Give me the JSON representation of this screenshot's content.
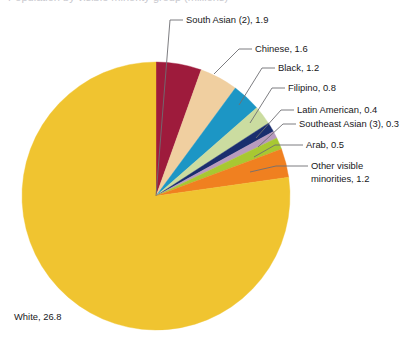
{
  "page": {
    "background_color": "#ffffff",
    "truncated_title": "Population by visible minority group (millions)"
  },
  "chart_data": {
    "type": "pie",
    "title": "",
    "xlabel": "",
    "ylabel": "",
    "units": "millions",
    "total": 34.7,
    "legend_position": "callout-labels",
    "grid": false,
    "categories": [
      "White",
      "South Asian (2)",
      "Chinese",
      "Black",
      "Filipino",
      "Latin American",
      "Southeast Asian (3)",
      "Arab",
      "Other visible minorities"
    ],
    "values": [
      26.8,
      1.9,
      1.6,
      1.2,
      0.8,
      0.4,
      0.3,
      0.5,
      1.2
    ],
    "colors": [
      "#F0C430",
      "#9E1B3C",
      "#F0CFA0",
      "#1C96C5",
      "#CBDCA0",
      "#1A2E6E",
      "#B89BBE",
      "#A8C832",
      "#F08020"
    ],
    "slices": [
      {
        "label": "White",
        "value": 26.8,
        "display": "White, 26.8",
        "color": "#F0C430"
      },
      {
        "label": "South Asian (2)",
        "value": 1.9,
        "display": "South Asian (2), 1.9",
        "color": "#9E1B3C"
      },
      {
        "label": "Chinese",
        "value": 1.6,
        "display": "Chinese, 1.6",
        "color": "#F0CFA0"
      },
      {
        "label": "Black",
        "value": 1.2,
        "display": "Black, 1.2",
        "color": "#1C96C5"
      },
      {
        "label": "Filipino",
        "value": 0.8,
        "display": "Filipino, 0.8",
        "color": "#CBDCA0"
      },
      {
        "label": "Latin American",
        "value": 0.4,
        "display": "Latin American, 0.4",
        "color": "#1A2E6E"
      },
      {
        "label": "Southeast Asian (3)",
        "value": 0.3,
        "display": "Southeast Asian (3), 0.3",
        "color": "#B89BBE"
      },
      {
        "label": "Arab",
        "value": 0.5,
        "display": "Arab, 0.5",
        "color": "#A8C832"
      },
      {
        "label": "Other visible minorities",
        "value": 1.2,
        "display": "Other visible minorities, 1.2",
        "color": "#F08020"
      }
    ]
  },
  "labels": {
    "south_asian": "South Asian (2), 1.9",
    "chinese": "Chinese, 1.6",
    "black": "Black, 1.2",
    "filipino": "Filipino, 0.8",
    "latin_american": "Latin American, 0.4",
    "southeast_asian": "Southeast Asian (3), 0.3",
    "arab": "Arab, 0.5",
    "other_line1": "Other visible",
    "other_line2": "minorities, 1.2",
    "white": "White, 26.8"
  },
  "geometry": {
    "center_x": 156,
    "center_y": 196,
    "radius": 134,
    "start_angle_deg": -90
  }
}
